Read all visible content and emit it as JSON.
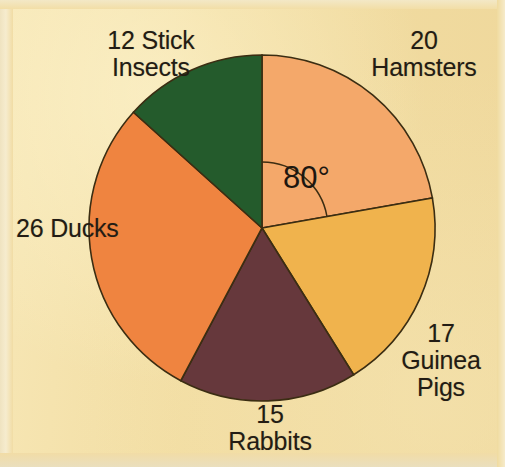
{
  "figure": {
    "kind": "pie-chart-worksheet-figure",
    "background_color": "#f2dda4",
    "outline_color": "#3b2d12"
  },
  "angle_annotation": {
    "text": "80°",
    "value": 80,
    "unit": "degrees",
    "from_slice": "Hamsters",
    "measured_from": "vertical-12-oclock",
    "direction": "clockwise"
  },
  "labels": {
    "stick_insects": "12 Stick\nInsects",
    "hamsters": "20\nHamsters",
    "guinea_pigs": "17\nGuinea\nPigs",
    "rabbits": "15\nRabbits",
    "ducks": "26 Ducks"
  },
  "chart_data": {
    "type": "pie",
    "title": "",
    "xlabel": "",
    "ylabel": "",
    "total": 90,
    "units": "animals",
    "start_angle_deg": 0,
    "direction": "clockwise",
    "legend": "none-inline-labels",
    "grid": false,
    "center": {
      "x": 262,
      "y": 228
    },
    "radius": 173,
    "categories": [
      "Hamsters",
      "Guinea Pigs",
      "Rabbits",
      "Ducks",
      "Stick Insects"
    ],
    "values": [
      20,
      17,
      15,
      26,
      12
    ],
    "slices": [
      {
        "name": "Hamsters",
        "value": 20,
        "angle_deg": 80,
        "percent": 22.2,
        "color": "#f4a86a",
        "start_deg": 0,
        "end_deg": 80,
        "label": "20\nHamsters"
      },
      {
        "name": "Guinea Pigs",
        "value": 17,
        "angle_deg": 68,
        "percent": 18.9,
        "color": "#f0b košt",
        "start_deg": 80,
        "end_deg": 148,
        "label": "17\nGuinea\nPigs"
      },
      {
        "name": "Rabbits",
        "value": 15,
        "angle_deg": 60,
        "percent": 16.7,
        "color": "#66383c",
        "start_deg": 148,
        "end_deg": 208,
        "label": "15\nRabbits"
      },
      {
        "name": "Ducks",
        "value": 26,
        "angle_deg": 104,
        "percent": 28.9,
        "color": "#ef8440",
        "start_deg": 208,
        "end_deg": 312,
        "label": "26 Ducks"
      },
      {
        "name": "Stick Insects",
        "value": 12,
        "angle_deg": 48,
        "percent": 13.3,
        "color": "#245b2c",
        "start_deg": 312,
        "end_deg": 360,
        "label": "12 Stick\nInsects"
      }
    ],
    "colors": [
      "#f4a86a",
      "#f0b34d",
      "#66383c",
      "#ef8440",
      "#245b2c"
    ]
  }
}
